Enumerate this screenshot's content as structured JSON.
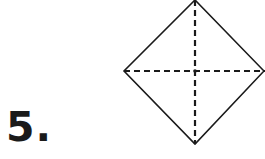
{
  "problem": {
    "number_label": "5."
  },
  "figure": {
    "shape": "square rotated 45° (diamond) with dashed diagonals",
    "vertices": {
      "top": [
        195,
        0
      ],
      "left": [
        124,
        71
      ],
      "right": [
        265,
        71
      ],
      "bottom": [
        195,
        144
      ]
    },
    "stroke_color": "#1a1a1a",
    "dash_pattern": "6 4"
  }
}
